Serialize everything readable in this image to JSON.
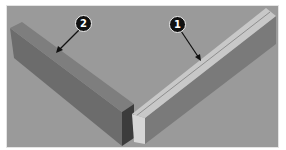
{
  "figure": {
    "background_color": "#9a9a9a",
    "callouts": [
      {
        "label": "1",
        "target": "right-board-top-face",
        "x": 177,
        "y": 24
      },
      {
        "label": "2",
        "target": "left-board-top-face",
        "x": 83,
        "y": 23
      }
    ],
    "parts": {
      "left_board": {
        "top_color": "#7c7c7c",
        "side_color": "#6a6a6a",
        "end_color": "#3a3a3a"
      },
      "right_board": {
        "top_color": "#c9c9c9",
        "side_color": "#7a7a7a",
        "end_color": "#d4d4d4",
        "groove_color": "#8a8a8a"
      }
    }
  }
}
